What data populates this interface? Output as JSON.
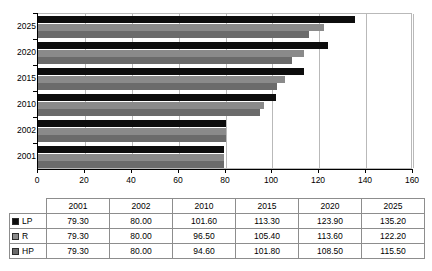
{
  "chart_data": {
    "type": "bar",
    "orientation": "horizontal",
    "title": "",
    "xlabel": "",
    "ylabel": "",
    "xlim": [
      0,
      160
    ],
    "xticks": [
      0,
      20,
      40,
      60,
      80,
      100,
      120,
      140,
      160
    ],
    "grid": true,
    "legend_position": "table-row-labels",
    "categories": [
      "2001",
      "2002",
      "2010",
      "2015",
      "2020",
      "2025"
    ],
    "category_order_top_to_bottom": [
      "2025",
      "2020",
      "2015",
      "2010",
      "2002",
      "2001"
    ],
    "series": [
      {
        "name": "LP",
        "color": "#0d0d0d",
        "values": [
          79.3,
          80.0,
          101.6,
          113.3,
          123.9,
          135.2
        ],
        "labels": [
          "79.30",
          "80.00",
          "101.60",
          "113.30",
          "123.90",
          "135.20"
        ]
      },
      {
        "name": "R",
        "color": "#8a8a8a",
        "values": [
          79.3,
          80.0,
          96.5,
          105.4,
          113.6,
          122.2
        ],
        "labels": [
          "79.30",
          "80.00",
          "96.50",
          "105.40",
          "113.60",
          "122.20"
        ]
      },
      {
        "name": "HP",
        "color": "#6b6b6b",
        "values": [
          79.3,
          80.0,
          94.6,
          101.8,
          108.5,
          115.5
        ],
        "labels": [
          "79.30",
          "80.00",
          "94.60",
          "101.80",
          "108.50",
          "115.50"
        ]
      }
    ]
  },
  "table": {
    "corner_label": "",
    "column_headers": [
      "2001",
      "2002",
      "2010",
      "2015",
      "2020",
      "2025"
    ],
    "rows": [
      {
        "label": "LP",
        "swatch": "legend-swatch-lp",
        "values": [
          "79.30",
          "80.00",
          "101.60",
          "113.30",
          "123.90",
          "135.20"
        ]
      },
      {
        "label": "R",
        "swatch": "legend-swatch-r",
        "values": [
          "79.30",
          "80.00",
          "96.50",
          "105.40",
          "113.60",
          "122.20"
        ]
      },
      {
        "label": "HP",
        "swatch": "legend-swatch-hp",
        "values": [
          "79.30",
          "80.00",
          "94.60",
          "101.80",
          "108.50",
          "115.50"
        ]
      }
    ]
  }
}
